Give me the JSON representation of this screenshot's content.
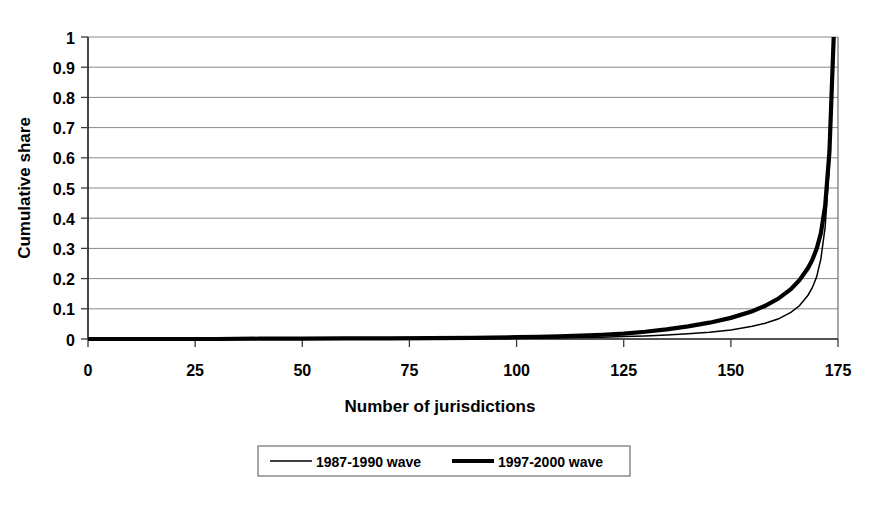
{
  "chart_data": {
    "type": "line",
    "title": "",
    "xlabel": "Number of jurisdictions",
    "ylabel": "Cumulative share",
    "xlim": [
      0,
      175
    ],
    "ylim": [
      0,
      1
    ],
    "grid": "horizontal",
    "legend_position": "bottom",
    "xticks": [
      "0",
      "25",
      "50",
      "75",
      "100",
      "125",
      "150",
      "175"
    ],
    "xtick_values": [
      0,
      25,
      50,
      75,
      100,
      125,
      150,
      175
    ],
    "yticks": [
      "0",
      "0.1",
      "0.2",
      "0.3",
      "0.4",
      "0.5",
      "0.6",
      "0.7",
      "0.8",
      "0.9",
      "1"
    ],
    "ytick_values": [
      0,
      0.1,
      0.2,
      0.3,
      0.4,
      0.5,
      0.6,
      0.7,
      0.8,
      0.9,
      1
    ],
    "x": [
      0,
      10,
      20,
      30,
      40,
      50,
      60,
      70,
      80,
      90,
      100,
      105,
      110,
      115,
      120,
      125,
      130,
      135,
      140,
      145,
      150,
      155,
      158,
      161,
      164,
      166,
      168,
      169,
      170,
      171,
      172,
      173,
      174
    ],
    "series": [
      {
        "name": "1987-1990 wave",
        "line_style": "thin",
        "color": "#000000",
        "values": [
          0,
          0,
          0,
          0,
          0,
          0,
          0.001,
          0.001,
          0.002,
          0.002,
          0.003,
          0.004,
          0.004,
          0.005,
          0.006,
          0.008,
          0.01,
          0.013,
          0.017,
          0.022,
          0.03,
          0.042,
          0.052,
          0.066,
          0.088,
          0.11,
          0.145,
          0.17,
          0.205,
          0.265,
          0.37,
          0.58,
          1.0
        ]
      },
      {
        "name": "1997-2000 wave",
        "line_style": "thick",
        "color": "#000000",
        "values": [
          0,
          0,
          0,
          0,
          0.001,
          0.001,
          0.002,
          0.002,
          0.003,
          0.004,
          0.006,
          0.007,
          0.009,
          0.011,
          0.014,
          0.018,
          0.024,
          0.032,
          0.042,
          0.054,
          0.07,
          0.092,
          0.11,
          0.133,
          0.165,
          0.195,
          0.235,
          0.262,
          0.298,
          0.35,
          0.44,
          0.62,
          1.0
        ]
      }
    ]
  },
  "legend": {
    "entries": [
      {
        "label": "1987-1990 wave",
        "style": "thin"
      },
      {
        "label": "1997-2000 wave",
        "style": "thick"
      }
    ]
  }
}
